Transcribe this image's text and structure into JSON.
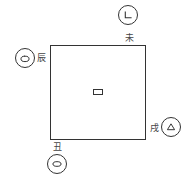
{
  "diagram": {
    "square": {
      "stroke": "#333333"
    },
    "center_marker": {
      "shape": "small-rectangle"
    },
    "nodes": [
      {
        "id": "top-right",
        "label": "未",
        "icon": "corner-line-icon"
      },
      {
        "id": "left",
        "label": "辰",
        "icon": "bowl-icon"
      },
      {
        "id": "right",
        "label": "戌",
        "icon": "triangle-icon"
      },
      {
        "id": "bottom",
        "label": "丑",
        "icon": "ellipse-icon"
      }
    ]
  }
}
